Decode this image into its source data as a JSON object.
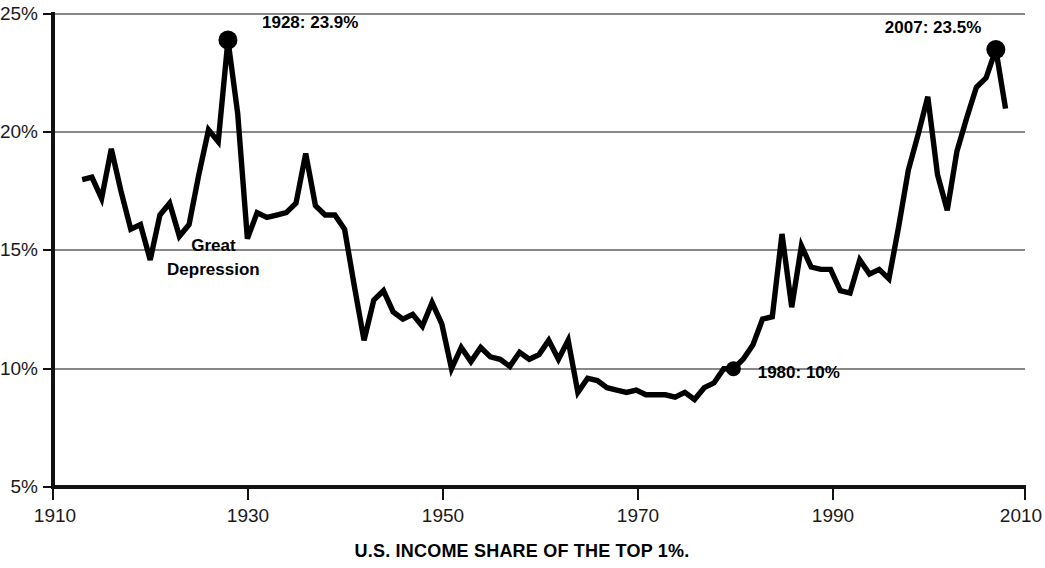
{
  "chart_data": {
    "type": "line",
    "title": "U.S. INCOME SHARE OF THE TOP 1%.",
    "xlabel": "",
    "ylabel": "",
    "xlim": [
      1910,
      2010
    ],
    "ylim": [
      5,
      25
    ],
    "grid": true,
    "legend": "none",
    "x_ticks": [
      1910,
      1930,
      1950,
      1970,
      1990,
      2010
    ],
    "x_tick_labels": [
      "1910",
      "1930",
      "1950",
      "1970",
      "1990",
      "2010"
    ],
    "y_ticks": [
      5,
      10,
      15,
      20,
      25
    ],
    "y_tick_labels": [
      "5%",
      "10%",
      "15%",
      "20%",
      "25%"
    ],
    "series": [
      {
        "name": "Top 1% income share",
        "x": [
          1913,
          1914,
          1915,
          1916,
          1917,
          1918,
          1919,
          1920,
          1921,
          1922,
          1923,
          1924,
          1925,
          1926,
          1927,
          1928,
          1929,
          1930,
          1931,
          1932,
          1933,
          1934,
          1935,
          1936,
          1937,
          1938,
          1939,
          1940,
          1941,
          1942,
          1943,
          1944,
          1945,
          1946,
          1947,
          1948,
          1949,
          1950,
          1951,
          1952,
          1953,
          1954,
          1955,
          1956,
          1957,
          1958,
          1959,
          1960,
          1961,
          1962,
          1963,
          1964,
          1965,
          1966,
          1967,
          1968,
          1969,
          1970,
          1971,
          1972,
          1973,
          1974,
          1975,
          1976,
          1977,
          1978,
          1979,
          1980,
          1981,
          1982,
          1983,
          1984,
          1985,
          1986,
          1987,
          1988,
          1989,
          1990,
          1991,
          1992,
          1993,
          1994,
          1995,
          1996,
          1997,
          1998,
          1999,
          2000,
          2001,
          2002,
          2003,
          2004,
          2005,
          2006,
          2007,
          2008
        ],
        "y": [
          18.0,
          18.1,
          17.2,
          19.3,
          17.5,
          15.9,
          16.1,
          14.6,
          16.5,
          17.0,
          15.6,
          16.1,
          18.2,
          20.1,
          19.6,
          23.9,
          20.8,
          15.5,
          16.6,
          16.4,
          16.5,
          16.6,
          17.0,
          19.1,
          16.9,
          16.5,
          16.5,
          15.9,
          13.5,
          11.2,
          12.9,
          13.3,
          12.4,
          12.1,
          12.3,
          11.8,
          12.8,
          11.9,
          10.0,
          10.9,
          10.3,
          10.9,
          10.5,
          10.4,
          10.1,
          10.7,
          10.4,
          10.6,
          11.2,
          10.4,
          11.2,
          9.0,
          9.6,
          9.5,
          9.2,
          9.1,
          9.0,
          9.1,
          8.9,
          8.9,
          8.9,
          8.8,
          9.0,
          8.7,
          9.2,
          9.4,
          10.0,
          10.0,
          10.4,
          11.0,
          12.1,
          12.2,
          15.7,
          12.6,
          15.2,
          14.3,
          14.2,
          14.2,
          13.3,
          13.2,
          14.6,
          14.0,
          14.2,
          13.8,
          16.0,
          18.4,
          19.9,
          21.5,
          18.2,
          16.7,
          19.2,
          20.6,
          21.9,
          22.3,
          23.5,
          21.0
        ]
      }
    ],
    "annotations": [
      {
        "id": "peak-1928",
        "label": "1928: 23.9%",
        "year": 1928,
        "value": 23.9,
        "marker": true,
        "label_x": 1931.5,
        "label_y": 24.4
      },
      {
        "id": "great-depression",
        "line1": "Great",
        "line2": "Depression",
        "year": 1926.5,
        "label_y": 15.0
      },
      {
        "id": "point-1980",
        "label": "1980: 10%",
        "year": 1980,
        "value": 10.0,
        "marker": true,
        "label_x": 1982.5,
        "label_y": 9.6
      },
      {
        "id": "peak-2007",
        "label": "2007: 23.5%",
        "year": 2007,
        "value": 23.5,
        "marker": true,
        "label_x": 2005.5,
        "label_y": 24.2,
        "anchor": "end"
      }
    ]
  }
}
